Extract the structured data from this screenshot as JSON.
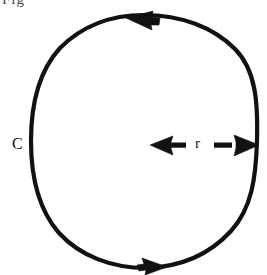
{
  "figure": {
    "background_color": "#ffffff",
    "ink_color": "#111111",
    "width": 267,
    "height": 275,
    "clipped_caption_fragment": "Fig",
    "labels": {
      "curve_label": "C",
      "radius_label": "r"
    },
    "circle": {
      "center_x": 144,
      "center_y": 141,
      "radius_x": 113,
      "radius_y": 127,
      "stroke_width": 4,
      "orientation": "counterclockwise"
    },
    "orientation_arrows": [
      {
        "name": "top-arrowhead",
        "x": 143,
        "y": 17,
        "direction": "left"
      },
      {
        "name": "bottom-arrowhead",
        "x": 150,
        "y": 265,
        "direction": "right"
      }
    ],
    "radius_arrow": {
      "name": "radius-double-arrow",
      "y": 145,
      "left_tip_x": 150,
      "right_tip_x": 258,
      "direction": "double-headed"
    }
  }
}
